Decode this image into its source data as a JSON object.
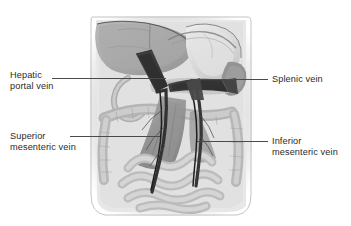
{
  "figure": {
    "kind": "anatomical-illustration",
    "style": "grayscale halftone medical illustration",
    "palette": {
      "background": "#ffffff",
      "body_wall": "#dcdcdc",
      "peritoneum": "#cfcfcf",
      "liver": "#a9a9a9",
      "stomach": "#d8d8d8",
      "spleen": "#8f8f8f",
      "intestine_light": "#cccccc",
      "intestine_mid": "#b4b4b4",
      "mesentery": "#8a8a8a",
      "vein_dark": "#2e2e2e",
      "vein_mid": "#4a4a4a",
      "leader_line": "#4a4a4a",
      "text": "#2b2b2b"
    }
  },
  "labels": {
    "hepatic_portal_vein": {
      "line1": "Hepatic",
      "line2": "portal vein"
    },
    "splenic_vein": {
      "line1": "Splenic vein"
    },
    "superior_mesenteric_vein": {
      "line1": "Superior",
      "line2": "mesenteric vein"
    },
    "inferior_mesenteric_vein": {
      "line1": "Inferior",
      "line2": "mesenteric vein"
    }
  },
  "leader_lines": [
    {
      "name": "hepatic-portal-vein-leader",
      "x1": 52,
      "y1": 78,
      "x2": 166,
      "y2": 78
    },
    {
      "name": "splenic-vein-leader",
      "x1": 190,
      "y1": 79,
      "x2": 268,
      "y2": 79
    },
    {
      "name": "superior-mesenteric-vein-leader",
      "x1": 70,
      "y1": 136,
      "x2": 160,
      "y2": 136
    },
    {
      "name": "inferior-mesenteric-vein-leader",
      "x1": 197,
      "y1": 141,
      "x2": 268,
      "y2": 141
    }
  ]
}
